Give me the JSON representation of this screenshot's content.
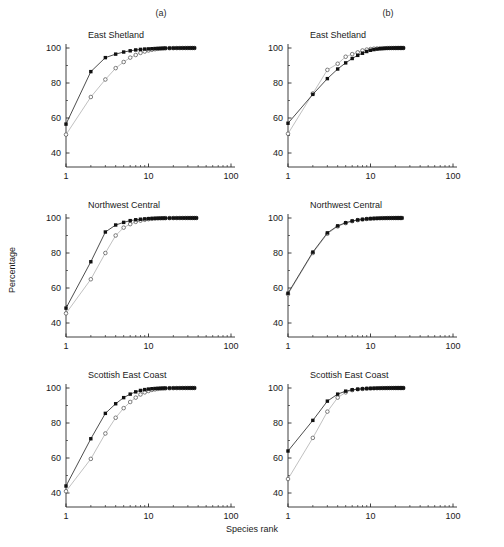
{
  "figure": {
    "column_labels": [
      "(a)",
      "(b)"
    ],
    "xlabel": "Species rank",
    "ylabel": "Percentage"
  },
  "chart_data": [
    {
      "type": "line",
      "panel": "a",
      "title": "East Shetland",
      "xlabel": "Species rank",
      "ylabel": "Percentage",
      "xscale": "log",
      "xlim": [
        1,
        100
      ],
      "ylim": [
        32,
        103
      ],
      "yticks": [
        40,
        60,
        80,
        100
      ],
      "xticks": [
        1,
        10,
        100
      ],
      "grid": false,
      "legend": "none",
      "series": [
        {
          "name": "filled-squares",
          "marker": "filled-square",
          "color": "#202020",
          "x": [
            1,
            2,
            3,
            4,
            5,
            6,
            7,
            8,
            9,
            10,
            11,
            12,
            13,
            14,
            15,
            16,
            18,
            20,
            22,
            24,
            26,
            28,
            30,
            32,
            34,
            36
          ],
          "y": [
            56.5,
            86.5,
            94.5,
            96.5,
            97.7,
            98.4,
            98.9,
            99.2,
            99.4,
            99.5,
            99.6,
            99.7,
            99.75,
            99.8,
            99.85,
            99.9,
            99.92,
            99.94,
            99.96,
            99.97,
            99.98,
            99.99,
            100,
            100,
            100,
            100
          ]
        },
        {
          "name": "open-circles",
          "marker": "open-circle",
          "color": "#b9b9b9",
          "x": [
            1,
            2,
            3,
            4,
            5,
            6,
            7,
            8,
            9,
            10,
            11,
            12,
            13,
            14,
            15,
            16,
            18,
            20,
            22,
            24,
            26,
            28,
            30,
            32,
            34,
            36
          ],
          "y": [
            50.5,
            72.0,
            82.0,
            88.5,
            92.0,
            94.5,
            96.0,
            97.2,
            98.0,
            98.6,
            99.0,
            99.3,
            99.5,
            99.6,
            99.7,
            99.8,
            99.88,
            99.92,
            99.95,
            99.97,
            99.98,
            99.99,
            100,
            100,
            100,
            100
          ]
        }
      ]
    },
    {
      "type": "line",
      "panel": "b",
      "title": "East Shetland",
      "xlabel": "Species rank",
      "ylabel": "Percentage",
      "xscale": "log",
      "xlim": [
        1,
        100
      ],
      "ylim": [
        32,
        103
      ],
      "yticks": [
        40,
        60,
        80,
        100
      ],
      "xticks": [
        1,
        10,
        100
      ],
      "grid": false,
      "legend": "none",
      "series": [
        {
          "name": "filled-squares",
          "marker": "filled-square",
          "color": "#202020",
          "x": [
            1,
            2,
            3,
            4,
            5,
            6,
            7,
            8,
            9,
            10,
            11,
            12,
            13,
            14,
            15,
            16,
            17,
            18,
            19,
            20,
            21,
            22,
            23,
            24,
            25
          ],
          "y": [
            57.0,
            73.5,
            82.5,
            88.0,
            91.5,
            94.0,
            95.8,
            97.0,
            98.0,
            98.7,
            99.1,
            99.4,
            99.6,
            99.7,
            99.8,
            99.87,
            99.91,
            99.94,
            99.96,
            99.97,
            99.98,
            99.99,
            100,
            100,
            100
          ]
        },
        {
          "name": "open-circles",
          "marker": "open-circle",
          "color": "#b9b9b9",
          "x": [
            1,
            2,
            3,
            4,
            5,
            6,
            7,
            8,
            9,
            10,
            11,
            12,
            13,
            14,
            15,
            16,
            17,
            18,
            19,
            20,
            21,
            22,
            23,
            24,
            25
          ],
          "y": [
            51.0,
            74.0,
            87.5,
            91.0,
            95.0,
            96.5,
            97.5,
            98.6,
            99.1,
            99.4,
            99.6,
            99.7,
            99.8,
            99.86,
            99.9,
            99.93,
            99.95,
            99.96,
            99.97,
            99.98,
            99.99,
            100,
            100,
            100,
            100
          ]
        }
      ]
    },
    {
      "type": "line",
      "panel": "a",
      "title": "Northwest Central",
      "xlabel": "Species rank",
      "ylabel": "Percentage",
      "xscale": "log",
      "xlim": [
        1,
        100
      ],
      "ylim": [
        32,
        103
      ],
      "yticks": [
        40,
        60,
        80,
        100
      ],
      "xticks": [
        1,
        10,
        100
      ],
      "grid": false,
      "legend": "none",
      "series": [
        {
          "name": "filled-squares",
          "marker": "filled-square",
          "color": "#202020",
          "x": [
            1,
            2,
            3,
            4,
            5,
            6,
            7,
            8,
            9,
            10,
            11,
            12,
            13,
            14,
            15,
            16,
            18,
            20,
            22,
            24,
            26,
            28,
            30,
            32,
            34,
            36,
            38
          ],
          "y": [
            48.5,
            75.0,
            92.0,
            96.0,
            97.5,
            98.5,
            99.0,
            99.3,
            99.5,
            99.65,
            99.75,
            99.8,
            99.85,
            99.88,
            99.9,
            99.92,
            99.94,
            99.96,
            99.97,
            99.98,
            99.99,
            100,
            100,
            100,
            100,
            100,
            100
          ]
        },
        {
          "name": "open-circles",
          "marker": "open-circle",
          "color": "#b9b9b9",
          "x": [
            1,
            2,
            3,
            4,
            5,
            6,
            7,
            8,
            9,
            10,
            11,
            12,
            13,
            14,
            15,
            16,
            18,
            20,
            22,
            24,
            26,
            28,
            30,
            32,
            34,
            36,
            38
          ],
          "y": [
            45.5,
            65.0,
            80.0,
            90.0,
            94.5,
            96.5,
            97.8,
            98.5,
            99.0,
            99.35,
            99.55,
            99.7,
            99.78,
            99.84,
            99.88,
            99.91,
            99.94,
            99.96,
            99.97,
            99.98,
            99.99,
            100,
            100,
            100,
            100,
            100,
            100
          ]
        }
      ]
    },
    {
      "type": "line",
      "panel": "b",
      "title": "Northwest Central",
      "xlabel": "Species rank",
      "ylabel": "Percentage",
      "xscale": "log",
      "xlim": [
        1,
        100
      ],
      "ylim": [
        32,
        103
      ],
      "yticks": [
        40,
        60,
        80,
        100
      ],
      "xticks": [
        1,
        10,
        100
      ],
      "grid": false,
      "legend": "none",
      "series": [
        {
          "name": "filled-squares",
          "marker": "filled-square",
          "color": "#202020",
          "x": [
            1,
            2,
            3,
            4,
            5,
            6,
            7,
            8,
            9,
            10,
            11,
            12,
            13,
            14,
            15,
            16,
            17,
            18,
            19,
            20,
            21,
            22,
            23,
            24
          ],
          "y": [
            57.0,
            80.5,
            91.5,
            95.5,
            97.3,
            98.3,
            98.9,
            99.2,
            99.5,
            99.65,
            99.75,
            99.82,
            99.87,
            99.9,
            99.93,
            99.95,
            99.96,
            99.97,
            99.98,
            99.99,
            100,
            100,
            100,
            100
          ]
        },
        {
          "name": "open-circles",
          "marker": "open-circle",
          "color": "#b9b9b9",
          "x": [
            1,
            2,
            3,
            4,
            5,
            6,
            7,
            8,
            9,
            10,
            11,
            12,
            13,
            14,
            15,
            16,
            17,
            18,
            19,
            20,
            21,
            22,
            23,
            24
          ],
          "y": [
            56.5,
            80.0,
            91.0,
            95.2,
            97.1,
            98.2,
            98.8,
            99.2,
            99.45,
            99.6,
            99.72,
            99.8,
            99.86,
            99.9,
            99.93,
            99.95,
            99.96,
            99.97,
            99.98,
            99.99,
            100,
            100,
            100,
            100
          ]
        }
      ]
    },
    {
      "type": "line",
      "panel": "a",
      "title": "Scottish East Coast",
      "xlabel": "Species rank",
      "ylabel": "Percentage",
      "xscale": "log",
      "xlim": [
        1,
        100
      ],
      "ylim": [
        32,
        103
      ],
      "yticks": [
        40,
        60,
        80,
        100
      ],
      "xticks": [
        1,
        10,
        100
      ],
      "grid": false,
      "legend": "none",
      "series": [
        {
          "name": "filled-squares",
          "marker": "filled-square",
          "color": "#202020",
          "x": [
            1,
            2,
            3,
            4,
            5,
            6,
            7,
            8,
            9,
            10,
            11,
            12,
            13,
            14,
            15,
            16,
            18,
            20,
            22,
            24,
            26,
            28,
            30,
            32,
            34,
            36
          ],
          "y": [
            44.0,
            71.0,
            85.5,
            91.0,
            94.5,
            96.5,
            97.8,
            98.6,
            99.1,
            99.4,
            99.6,
            99.72,
            99.8,
            99.85,
            99.89,
            99.92,
            99.95,
            99.97,
            99.98,
            99.99,
            100,
            100,
            100,
            100,
            100,
            100
          ]
        },
        {
          "name": "open-circles",
          "marker": "open-circle",
          "color": "#b9b9b9",
          "x": [
            1,
            2,
            3,
            4,
            5,
            6,
            7,
            8,
            9,
            10,
            11,
            12,
            13,
            14,
            15,
            16,
            18,
            20,
            22,
            24,
            26,
            28,
            30,
            32,
            34,
            36
          ],
          "y": [
            41.0,
            59.5,
            74.0,
            83.0,
            88.5,
            92.0,
            94.5,
            96.3,
            97.5,
            98.3,
            98.9,
            99.2,
            99.45,
            99.6,
            99.7,
            99.78,
            99.87,
            99.92,
            99.95,
            99.97,
            99.98,
            99.99,
            100,
            100,
            100,
            100
          ]
        }
      ]
    },
    {
      "type": "line",
      "panel": "b",
      "title": "Scottish East Coast",
      "xlabel": "Species rank",
      "ylabel": "Percentage",
      "xscale": "log",
      "xlim": [
        1,
        100
      ],
      "ylim": [
        32,
        103
      ],
      "yticks": [
        40,
        60,
        80,
        100
      ],
      "xticks": [
        1,
        10,
        100
      ],
      "grid": false,
      "legend": "none",
      "series": [
        {
          "name": "filled-squares",
          "marker": "filled-square",
          "color": "#202020",
          "x": [
            1,
            2,
            3,
            4,
            5,
            6,
            7,
            8,
            9,
            10,
            11,
            12,
            13,
            14,
            15,
            16,
            17,
            18,
            19,
            20,
            21,
            22,
            23,
            24,
            25
          ],
          "y": [
            64.0,
            81.5,
            92.5,
            96.5,
            98.2,
            99.0,
            99.3,
            99.55,
            99.7,
            99.78,
            99.84,
            99.88,
            99.91,
            99.93,
            99.95,
            99.96,
            99.97,
            99.98,
            99.99,
            100,
            100,
            100,
            100,
            100,
            100
          ]
        },
        {
          "name": "open-circles",
          "marker": "open-circle",
          "color": "#b9b9b9",
          "x": [
            1,
            2,
            3,
            4,
            5,
            6,
            7,
            8,
            9,
            10,
            11,
            12,
            13,
            14,
            15,
            16,
            17,
            18,
            19,
            20,
            21,
            22,
            23,
            24,
            25
          ],
          "y": [
            48.0,
            71.5,
            86.5,
            94.5,
            97.5,
            98.8,
            99.3,
            99.5,
            99.65,
            99.75,
            99.82,
            99.87,
            99.9,
            99.93,
            99.95,
            99.96,
            99.97,
            99.98,
            99.99,
            100,
            100,
            100,
            100,
            100,
            100
          ]
        }
      ]
    }
  ]
}
